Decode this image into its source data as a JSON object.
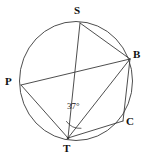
{
  "figure": {
    "name": "inscribed-polygon-in-circle",
    "background_color": "#ffffff",
    "stroke_color": "#3a3a3a",
    "text_color": "#111111"
  },
  "circle": {
    "center_x": 76,
    "center_y": 81,
    "radius": 57
  },
  "points": [
    {
      "id": "S",
      "label": "S",
      "x": 80,
      "y": 23,
      "label_x": 74,
      "label_y": 6
    },
    {
      "id": "B",
      "label": "B",
      "x": 130,
      "y": 59,
      "label_x": 134,
      "label_y": 50
    },
    {
      "id": "C",
      "label": "C",
      "x": 123,
      "y": 121,
      "label_x": 126,
      "label_y": 117
    },
    {
      "id": "T",
      "label": "T",
      "x": 68,
      "y": 138,
      "label_x": 63,
      "label_y": 143
    },
    {
      "id": "P",
      "label": "P",
      "x": 21,
      "y": 85,
      "label_x": 6,
      "label_y": 76
    }
  ],
  "chords": [
    {
      "id": "S-B",
      "from": "S",
      "to": "B"
    },
    {
      "id": "S-T",
      "from": "S",
      "to": "T"
    },
    {
      "id": "P-B",
      "from": "P",
      "to": "B"
    },
    {
      "id": "P-T",
      "from": "P",
      "to": "T"
    },
    {
      "id": "T-B",
      "from": "T",
      "to": "B"
    },
    {
      "id": "T-C",
      "from": "T",
      "to": "C"
    },
    {
      "id": "B-C",
      "from": "B",
      "to": "C"
    }
  ],
  "angles": [
    {
      "id": "angle-STB",
      "vertex": "T",
      "ray_a": "S",
      "ray_b": "B",
      "value": "37",
      "unit": "°",
      "label": "37°",
      "label_x": 67,
      "label_y": 103,
      "arc_radius": 17
    }
  ]
}
